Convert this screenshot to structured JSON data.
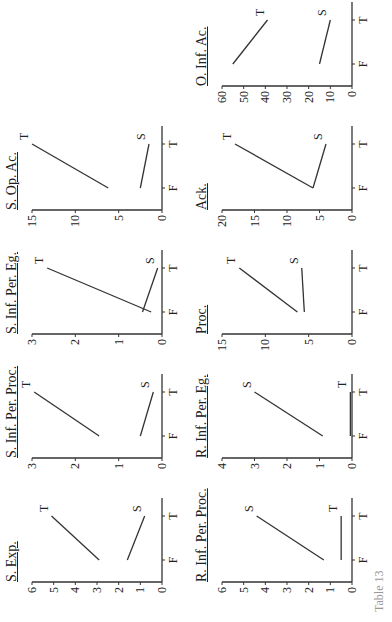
{
  "chart_data": [
    {
      "type": "line",
      "title": "S. Exp.",
      "categories": [
        "F",
        "T"
      ],
      "series": [
        {
          "name": "T",
          "values": [
            2.9,
            5.1
          ]
        },
        {
          "name": "S",
          "values": [
            1.6,
            0.8
          ]
        }
      ],
      "yticks": [
        0,
        1,
        2,
        3,
        4,
        5,
        6
      ],
      "ylim": [
        0,
        6
      ],
      "xlabel": "",
      "ylabel": ""
    },
    {
      "type": "line",
      "title": "S. Inf. Per. Proc.",
      "categories": [
        "F",
        "T"
      ],
      "series": [
        {
          "name": "T",
          "values": [
            1.45,
            2.95
          ]
        },
        {
          "name": "S",
          "values": [
            0.5,
            0.2
          ]
        }
      ],
      "yticks": [
        0,
        1,
        2,
        3
      ],
      "ylim": [
        0,
        3
      ],
      "xlabel": "",
      "ylabel": ""
    },
    {
      "type": "line",
      "title": "S. Inf. Per. Eg.",
      "categories": [
        "F",
        "T"
      ],
      "series": [
        {
          "name": "T",
          "values": [
            0.25,
            2.65
          ]
        },
        {
          "name": "S",
          "values": [
            0.45,
            0.1
          ]
        }
      ],
      "yticks": [
        0,
        1,
        2,
        3
      ],
      "ylim": [
        0,
        3
      ],
      "xlabel": "",
      "ylabel": ""
    },
    {
      "type": "line",
      "title": "S. Op. Ac.",
      "categories": [
        "F",
        "T"
      ],
      "series": [
        {
          "name": "T",
          "values": [
            6.2,
            15
          ]
        },
        {
          "name": "S",
          "values": [
            2.5,
            1.5
          ]
        }
      ],
      "yticks": [
        0,
        5,
        10,
        15
      ],
      "ylim": [
        0,
        15
      ],
      "xlabel": "",
      "ylabel": ""
    },
    {
      "type": "line",
      "title": "R. Inf. Per. Proc.",
      "categories": [
        "F",
        "T"
      ],
      "series": [
        {
          "name": "S",
          "values": [
            1.3,
            4.4
          ]
        },
        {
          "name": "T",
          "values": [
            0.5,
            0.5
          ]
        }
      ],
      "yticks": [
        0,
        1,
        2,
        3,
        4,
        5,
        6
      ],
      "ylim": [
        0,
        6
      ],
      "xlabel": "",
      "ylabel": ""
    },
    {
      "type": "line",
      "title": "R. Inf. Per. Eg.",
      "categories": [
        "F",
        "T"
      ],
      "series": [
        {
          "name": "S",
          "values": [
            0.9,
            3.0
          ]
        },
        {
          "name": "T",
          "values": [
            0.05,
            0.05
          ]
        }
      ],
      "yticks": [
        0,
        1,
        2,
        3,
        4
      ],
      "ylim": [
        0,
        4
      ],
      "xlabel": "",
      "ylabel": ""
    },
    {
      "type": "line",
      "title": "Proc.",
      "categories": [
        "F",
        "T"
      ],
      "series": [
        {
          "name": "T",
          "values": [
            6.3,
            13
          ]
        },
        {
          "name": "S",
          "values": [
            5.5,
            5.8
          ]
        }
      ],
      "yticks": [
        0,
        5,
        10,
        15
      ],
      "ylim": [
        0,
        15
      ],
      "xlabel": "",
      "ylabel": ""
    },
    {
      "type": "line",
      "title": "Ack.",
      "categories": [
        "F",
        "T"
      ],
      "series": [
        {
          "name": "T",
          "values": [
            6,
            18
          ]
        },
        {
          "name": "S",
          "values": [
            6,
            4
          ]
        }
      ],
      "yticks": [
        0,
        5,
        10,
        15,
        20
      ],
      "ylim": [
        0,
        20
      ],
      "xlabel": "",
      "ylabel": ""
    },
    {
      "type": "line",
      "title": "O. Inf. Ac.",
      "categories": [
        "F",
        "T"
      ],
      "series": [
        {
          "name": "T",
          "values": [
            55,
            39
          ]
        },
        {
          "name": "S",
          "values": [
            15,
            10
          ]
        }
      ],
      "yticks": [
        0,
        10,
        20,
        30,
        40,
        50,
        60
      ],
      "ylim": [
        0,
        60
      ],
      "xlabel": "",
      "ylabel": ""
    }
  ],
  "caption": "Table 13"
}
